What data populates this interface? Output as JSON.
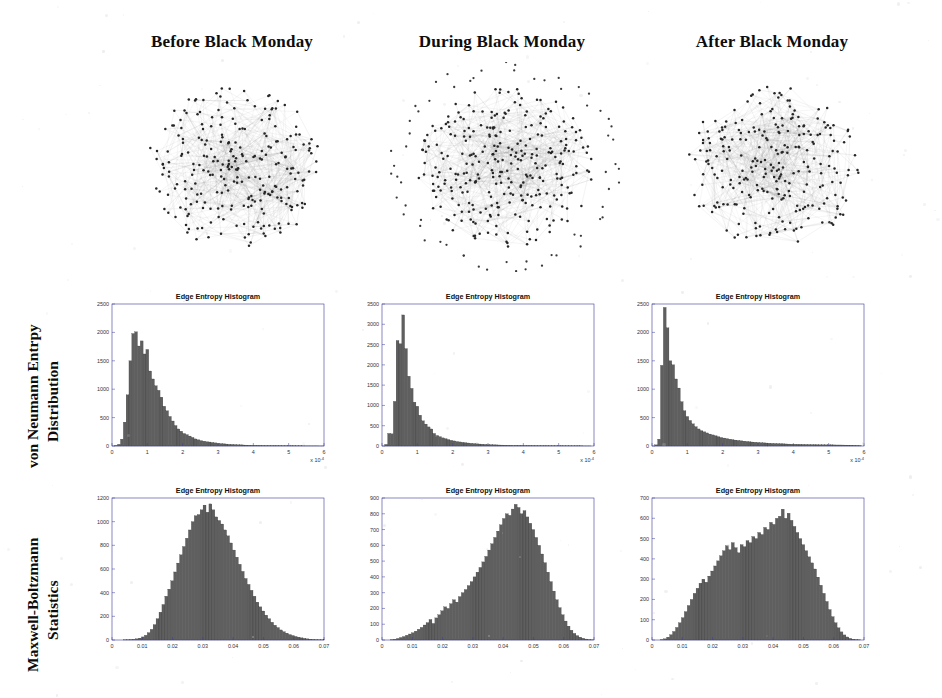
{
  "columns": [
    {
      "label": "Before Black Monday"
    },
    {
      "label": "During Black Monday"
    },
    {
      "label": "After Black Monday"
    }
  ],
  "rows": [
    {
      "label_line1": "von Neumann Entrpy",
      "label_line2": "Distribution"
    },
    {
      "label_line1": "Maxwell-Boltzmann",
      "label_line2": "Statistics"
    }
  ],
  "colors": {
    "bar_fill": "#5f5f5f",
    "bar_edge": "#2a2a2a",
    "axis": "#3a3a9a",
    "text": "#0d0d0d"
  },
  "network_graphs": [
    {
      "name": "before-black-monday-network",
      "nodes": 260,
      "layout": "circular-dense-core",
      "peripheral_nodes": 0
    },
    {
      "name": "during-black-monday-network",
      "nodes": 300,
      "layout": "dense-core-with-isolated-ring",
      "peripheral_nodes": 62
    },
    {
      "name": "after-black-monday-network",
      "nodes": 260,
      "layout": "circular-dense-core",
      "peripheral_nodes": 0
    }
  ],
  "chart_data": [
    {
      "name": "vn-before",
      "type": "bar",
      "title": "Edge Entropy Histogram",
      "xlabel": "",
      "ylabel": "",
      "xlim": [
        0,
        6
      ],
      "ylim": [
        0,
        2500
      ],
      "x_exponent": "x 10",
      "x_exponent_power": "-4",
      "xticks": [
        0,
        1,
        2,
        3,
        4,
        5,
        6
      ],
      "yticks": [
        0,
        500,
        1000,
        1500,
        2000,
        2500
      ],
      "bin_width": 0.08,
      "values": [
        0,
        10,
        30,
        120,
        420,
        900,
        1500,
        1980,
        2010,
        1760,
        1850,
        1620,
        1700,
        1320,
        1180,
        1060,
        980,
        860,
        700,
        620,
        520,
        440,
        360,
        300,
        260,
        220,
        200,
        175,
        150,
        125,
        110,
        95,
        85,
        75,
        70,
        62,
        55,
        48,
        42,
        38,
        34,
        30,
        28,
        25,
        22,
        20,
        18,
        16,
        14,
        13,
        12,
        11,
        10,
        9,
        8,
        8,
        7,
        7,
        6,
        6,
        5,
        5,
        4,
        4,
        4,
        3,
        3,
        3,
        2,
        2,
        2,
        2,
        2,
        1,
        1
      ]
    },
    {
      "name": "vn-during",
      "type": "bar",
      "title": "Edge Entropy Histogram",
      "xlabel": "",
      "ylabel": "",
      "xlim": [
        0,
        6
      ],
      "ylim": [
        0,
        3500
      ],
      "x_exponent": "x 10",
      "x_exponent_power": "-4",
      "xticks": [
        0,
        1,
        2,
        3,
        4,
        5,
        6
      ],
      "yticks": [
        0,
        500,
        1000,
        1500,
        2000,
        2500,
        3000,
        3500
      ],
      "bin_width": 0.08,
      "values": [
        0,
        40,
        310,
        300,
        1100,
        2600,
        2520,
        3230,
        2400,
        1720,
        1420,
        1080,
        980,
        760,
        620,
        540,
        470,
        420,
        310,
        260,
        230,
        200,
        180,
        160,
        140,
        125,
        110,
        100,
        90,
        82,
        74,
        66,
        60,
        54,
        48,
        44,
        40,
        36,
        33,
        30,
        27,
        25,
        23,
        21,
        19,
        17,
        16,
        15,
        14,
        13,
        12,
        11,
        10,
        10,
        9,
        8,
        8,
        7,
        7,
        6,
        6,
        5,
        5,
        5,
        4,
        4,
        4,
        3,
        3,
        3,
        3,
        2,
        2,
        2
      ]
    },
    {
      "name": "vn-after",
      "type": "bar",
      "title": "Edge Entropy Histogram",
      "xlabel": "",
      "ylabel": "",
      "xlim": [
        0,
        6
      ],
      "ylim": [
        0,
        2500
      ],
      "x_exponent": "x 10",
      "x_exponent_power": "-4",
      "xticks": [
        0,
        1,
        2,
        3,
        4,
        5,
        6
      ],
      "yticks": [
        0,
        500,
        1000,
        1500,
        2000,
        2500
      ],
      "bin_width": 0.08,
      "values": [
        0,
        20,
        120,
        1420,
        2440,
        2080,
        1500,
        1430,
        1180,
        1020,
        780,
        620,
        520,
        450,
        390,
        340,
        300,
        270,
        250,
        230,
        210,
        195,
        180,
        165,
        150,
        140,
        130,
        120,
        112,
        104,
        98,
        92,
        86,
        80,
        75,
        70,
        66,
        62,
        58,
        55,
        52,
        49,
        46,
        44,
        42,
        40,
        38,
        36,
        34,
        32,
        31,
        30,
        29,
        28,
        27,
        26,
        25,
        24,
        23,
        22,
        22,
        21,
        20,
        20,
        19,
        18,
        18,
        17,
        16,
        15,
        14,
        12,
        10,
        8
      ]
    },
    {
      "name": "mb-before",
      "type": "bar",
      "title": "Edge Entropy Histogram",
      "xlabel": "",
      "ylabel": "",
      "xlim": [
        0,
        0.07
      ],
      "ylim": [
        0,
        1200
      ],
      "xticks": [
        0,
        0.01,
        0.02,
        0.03,
        0.04,
        0.05,
        0.06,
        0.07
      ],
      "xtick_labels": [
        "0",
        "0.01",
        "0.02",
        "0.03",
        "0.04",
        "0.05",
        "0.06",
        "0.07"
      ],
      "yticks": [
        0,
        200,
        400,
        600,
        800,
        1000,
        1200
      ],
      "bin_width": 0.00097,
      "values": [
        0,
        0,
        0,
        0,
        1,
        2,
        4,
        6,
        10,
        16,
        26,
        40,
        62,
        90,
        130,
        180,
        235,
        300,
        370,
        430,
        500,
        575,
        650,
        720,
        790,
        860,
        930,
        1000,
        1050,
        1060,
        1100,
        1140,
        1080,
        1150,
        1100,
        1040,
        1010,
        980,
        930,
        880,
        820,
        760,
        700,
        640,
        580,
        520,
        470,
        420,
        370,
        320,
        280,
        245,
        210,
        180,
        150,
        125,
        105,
        85,
        70,
        58,
        46,
        38,
        30,
        24,
        18,
        14,
        10,
        7,
        5,
        3,
        2,
        1,
        1,
        0
      ]
    },
    {
      "name": "mb-during",
      "type": "bar",
      "title": "Edge Entropy Histogram",
      "xlabel": "",
      "ylabel": "",
      "xlim": [
        0,
        0.07
      ],
      "ylim": [
        0,
        900
      ],
      "xticks": [
        0,
        0.01,
        0.02,
        0.03,
        0.04,
        0.05,
        0.06,
        0.07
      ],
      "xtick_labels": [
        "0",
        "0.01",
        "0.02",
        "0.03",
        "0.04",
        "0.05",
        "0.06",
        "0.07"
      ],
      "yticks": [
        0,
        100,
        200,
        300,
        400,
        500,
        600,
        700,
        800,
        900
      ],
      "bin_width": 0.00097,
      "values": [
        0,
        0,
        0,
        2,
        5,
        10,
        16,
        22,
        30,
        38,
        46,
        56,
        68,
        80,
        95,
        110,
        130,
        105,
        140,
        160,
        185,
        210,
        200,
        230,
        255,
        240,
        275,
        300,
        320,
        345,
        370,
        400,
        430,
        460,
        495,
        530,
        570,
        610,
        650,
        690,
        730,
        770,
        800,
        790,
        830,
        860,
        840,
        800,
        820,
        780,
        740,
        700,
        650,
        600,
        545,
        490,
        430,
        370,
        310,
        255,
        205,
        160,
        120,
        88,
        62,
        42,
        28,
        18,
        11,
        6,
        3,
        1,
        0
      ]
    },
    {
      "name": "mb-after",
      "type": "bar",
      "title": "Edge Entropy Histogram",
      "xlabel": "",
      "ylabel": "",
      "xlim": [
        0,
        0.07
      ],
      "ylim": [
        0,
        700
      ],
      "xticks": [
        0,
        0.01,
        0.02,
        0.03,
        0.04,
        0.05,
        0.06,
        0.07
      ],
      "xtick_labels": [
        "0",
        "0.01",
        "0.02",
        "0.03",
        "0.04",
        "0.05",
        "0.06",
        "0.07"
      ],
      "yticks": [
        0,
        100,
        200,
        300,
        400,
        500,
        600,
        700
      ],
      "bin_width": 0.00097,
      "values": [
        0,
        0,
        0,
        2,
        6,
        14,
        26,
        42,
        62,
        85,
        110,
        140,
        170,
        200,
        230,
        255,
        280,
        300,
        285,
        315,
        340,
        365,
        390,
        415,
        440,
        465,
        445,
        480,
        455,
        430,
        470,
        460,
        490,
        480,
        510,
        500,
        530,
        520,
        555,
        545,
        580,
        570,
        600,
        610,
        645,
        600,
        625,
        590,
        560,
        530,
        500,
        470,
        440,
        410,
        380,
        350,
        310,
        270,
        230,
        190,
        150,
        115,
        85,
        60,
        40,
        25,
        15,
        8,
        4,
        2,
        1,
        0,
        0
      ]
    }
  ]
}
